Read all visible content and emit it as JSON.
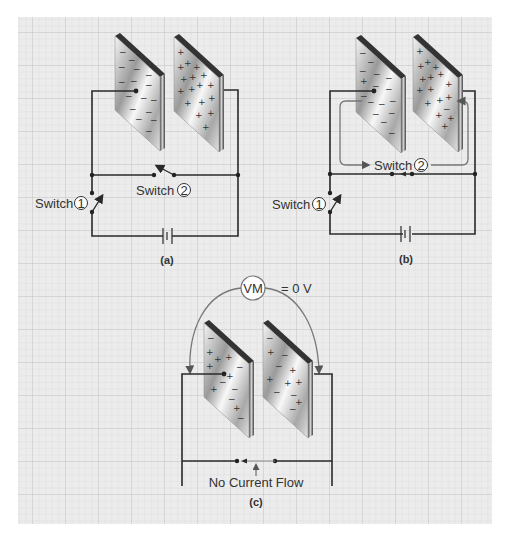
{
  "colors": {
    "grid_bg": "#ececec",
    "grid_line": "#d2d2d2",
    "grid_major": "#c4c4c4",
    "wire": "#2a2a2a",
    "loop": "#777777"
  },
  "panel_a": {
    "caption": "(a)",
    "switch1_label": "Switch",
    "switch1_number": "1",
    "switch2_label": "Switch",
    "switch2_number": "2",
    "left_plate_charge": "negative",
    "right_plate_charge": "positive"
  },
  "panel_b": {
    "caption": "(b)",
    "switch1_label": "Switch",
    "switch1_number": "1",
    "switch2_label": "Switch",
    "switch2_number": "2",
    "left_plate_charge": "mostly negative",
    "right_plate_charge": "mostly positive"
  },
  "panel_c": {
    "caption": "(c)",
    "meter_label": "VM",
    "meter_reading": "= 0 V",
    "flow_label": "No Current Flow",
    "left_plate_charge": "mixed",
    "right_plate_charge": "mixed"
  }
}
